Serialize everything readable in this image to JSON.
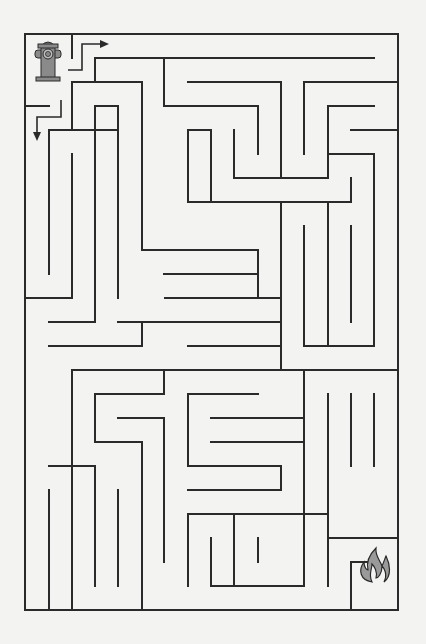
{
  "puzzle": {
    "type": "maze",
    "start": {
      "label": "fire-hydrant",
      "x": 48,
      "y": 63
    },
    "finish": {
      "label": "fire",
      "x": 378,
      "y": 582
    },
    "colors": {
      "wall": "#2a2a2a",
      "background": "#f3f3f1",
      "icon_fill": "#8a8a8a"
    },
    "outer_box": {
      "left": 25,
      "top": 34,
      "right": 398,
      "bottom": 610
    },
    "walls": [
      [
        25,
        34,
        398,
        34
      ],
      [
        25,
        34,
        25,
        610
      ],
      [
        25,
        610,
        398,
        610
      ],
      [
        398,
        34,
        398,
        610
      ],
      [
        72,
        34,
        72,
        58
      ],
      [
        95,
        58,
        374,
        58
      ],
      [
        95,
        58,
        95,
        82
      ],
      [
        72,
        82,
        142,
        82
      ],
      [
        72,
        82,
        72,
        130
      ],
      [
        142,
        82,
        142,
        178
      ],
      [
        188,
        82,
        281,
        82
      ],
      [
        281,
        82,
        281,
        178
      ],
      [
        304,
        82,
        398,
        82
      ],
      [
        304,
        82,
        304,
        154
      ],
      [
        164,
        58,
        164,
        106
      ],
      [
        25,
        106,
        49,
        106
      ],
      [
        95,
        106,
        118,
        106
      ],
      [
        118,
        106,
        118,
        298
      ],
      [
        164,
        106,
        258,
        106
      ],
      [
        258,
        106,
        258,
        154
      ],
      [
        328,
        106,
        374,
        106
      ],
      [
        328,
        106,
        328,
        178
      ],
      [
        49,
        130,
        118,
        130
      ],
      [
        49,
        130,
        49,
        274
      ],
      [
        188,
        130,
        211,
        130
      ],
      [
        188,
        130,
        188,
        202
      ],
      [
        211,
        130,
        211,
        202
      ],
      [
        234,
        130,
        234,
        178
      ],
      [
        351,
        130,
        398,
        130
      ],
      [
        72,
        154,
        72,
        298
      ],
      [
        142,
        130,
        142,
        250
      ],
      [
        234,
        178,
        328,
        178
      ],
      [
        328,
        154,
        374,
        154
      ],
      [
        374,
        154,
        374,
        346
      ],
      [
        211,
        202,
        281,
        202
      ],
      [
        188,
        202,
        211,
        202
      ],
      [
        281,
        202,
        351,
        202
      ],
      [
        351,
        178,
        351,
        202
      ],
      [
        281,
        202,
        281,
        370
      ],
      [
        304,
        226,
        304,
        322
      ],
      [
        328,
        202,
        328,
        346
      ],
      [
        351,
        226,
        351,
        322
      ],
      [
        25,
        298,
        72,
        298
      ],
      [
        49,
        322,
        95,
        322
      ],
      [
        95,
        322,
        95,
        106
      ],
      [
        142,
        250,
        258,
        250
      ],
      [
        258,
        250,
        258,
        298
      ],
      [
        164,
        274,
        258,
        274
      ],
      [
        165,
        298,
        281,
        298
      ],
      [
        118,
        322,
        281,
        322
      ],
      [
        188,
        346,
        281,
        346
      ],
      [
        49,
        346,
        142,
        346
      ],
      [
        142,
        346,
        142,
        322
      ],
      [
        304,
        346,
        374,
        346
      ],
      [
        304,
        346,
        304,
        298
      ],
      [
        72,
        370,
        164,
        370
      ],
      [
        72,
        370,
        72,
        610
      ],
      [
        95,
        394,
        164,
        394
      ],
      [
        95,
        394,
        95,
        442
      ],
      [
        95,
        442,
        142,
        442
      ],
      [
        142,
        442,
        142,
        478
      ],
      [
        118,
        418,
        164,
        418
      ],
      [
        164,
        418,
        164,
        562
      ],
      [
        164,
        370,
        398,
        370
      ],
      [
        164,
        370,
        164,
        394
      ],
      [
        188,
        394,
        258,
        394
      ],
      [
        188,
        394,
        188,
        466
      ],
      [
        188,
        466,
        281,
        466
      ],
      [
        281,
        466,
        281,
        490
      ],
      [
        211,
        418,
        304,
        418
      ],
      [
        211,
        442,
        304,
        442
      ],
      [
        188,
        490,
        281,
        490
      ],
      [
        304,
        370,
        304,
        586
      ],
      [
        351,
        394,
        351,
        466
      ],
      [
        328,
        394,
        328,
        586
      ],
      [
        374,
        394,
        374,
        466
      ],
      [
        49,
        466,
        95,
        466
      ],
      [
        95,
        466,
        95,
        586
      ],
      [
        49,
        490,
        49,
        610
      ],
      [
        118,
        490,
        118,
        586
      ],
      [
        142,
        466,
        142,
        610
      ],
      [
        164,
        490,
        164,
        562
      ],
      [
        188,
        514,
        328,
        514
      ],
      [
        188,
        514,
        188,
        586
      ],
      [
        234,
        514,
        234,
        586
      ],
      [
        211,
        538,
        211,
        586
      ],
      [
        258,
        538,
        258,
        562
      ],
      [
        211,
        586,
        258,
        586
      ],
      [
        258,
        586,
        304,
        586
      ],
      [
        328,
        538,
        398,
        538
      ],
      [
        328,
        538,
        328,
        562
      ],
      [
        351,
        562,
        374,
        562
      ],
      [
        351,
        562,
        351,
        610
      ]
    ],
    "arrows": [
      {
        "name": "entrance-arrow",
        "points": [
          [
            68,
            70
          ],
          [
            82,
            70
          ],
          [
            82,
            44
          ],
          [
            103,
            44
          ]
        ],
        "direction": "right"
      },
      {
        "name": "exit-arrow",
        "points": [
          [
            61,
            100
          ],
          [
            61,
            117
          ],
          [
            37,
            117
          ],
          [
            37,
            135
          ]
        ],
        "direction": "down"
      }
    ]
  }
}
